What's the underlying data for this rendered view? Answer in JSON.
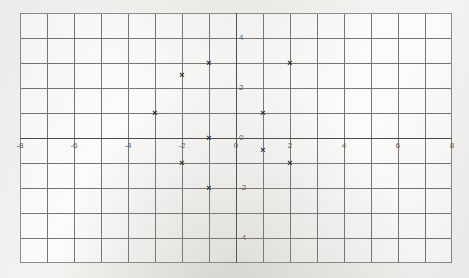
{
  "document": {
    "type": "scanned-graph-paper",
    "background_color": "#f4f3f1",
    "plot_background_color": "#fbfbfa",
    "grid_color": "#6b6b6b",
    "axis_color": "#4a4a4a",
    "marker_color": "#1d1d1d"
  },
  "chart_data": {
    "type": "scatter",
    "title": "",
    "subtitle": "",
    "xlabel": "",
    "ylabel": "",
    "xlim": [
      -8,
      8
    ],
    "ylim": [
      -5,
      5
    ],
    "grid": true,
    "grid_step_x": 1,
    "grid_step_y": 1,
    "legend": "none",
    "xticks": [
      -8,
      -6,
      -4,
      -2,
      0,
      2,
      4,
      6,
      8
    ],
    "xticklabels": [
      "-8",
      "-6",
      "-4",
      "-2",
      "0",
      "2",
      "4",
      "6",
      "8"
    ],
    "yticks": [
      4,
      2,
      0,
      -2,
      -4
    ],
    "yticklabels": [
      "4",
      "2",
      "0",
      "-2",
      "-4"
    ],
    "marker": "x",
    "points": [
      {
        "x": -3,
        "y": 1,
        "label": "point-1"
      },
      {
        "x": -2,
        "y": 2.5,
        "label": "point-2"
      },
      {
        "x": -2,
        "y": -1,
        "label": "point-3"
      },
      {
        "x": -1,
        "y": 3,
        "label": "point-4"
      },
      {
        "x": -1,
        "y": 0,
        "label": "point-5"
      },
      {
        "x": -1,
        "y": -2,
        "label": "point-6"
      },
      {
        "x": 1,
        "y": 1,
        "label": "point-7"
      },
      {
        "x": 1,
        "y": -0.5,
        "label": "point-8"
      },
      {
        "x": 2,
        "y": 3,
        "label": "point-9"
      },
      {
        "x": 2,
        "y": -1,
        "label": "point-10"
      }
    ]
  }
}
